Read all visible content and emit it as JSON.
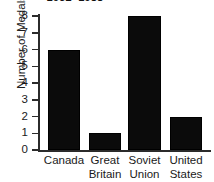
{
  "chart_data": {
    "type": "bar",
    "title": "1932–1988",
    "title_note": "cropped at top edge of screenshot",
    "xlabel": "",
    "ylabel": "Number of Medals",
    "categories": [
      "Canada",
      "Great Britain",
      "Soviet Union",
      "United States"
    ],
    "category_lines": [
      [
        "Canada",
        ""
      ],
      [
        "Great",
        "Britain"
      ],
      [
        "Soviet",
        "Union"
      ],
      [
        "United",
        "States"
      ]
    ],
    "values": [
      6,
      1,
      8,
      2
    ],
    "ylim": [
      0,
      8
    ],
    "yticks": [
      0,
      1,
      2,
      3,
      4,
      5,
      6,
      7,
      8
    ],
    "ytick_labels": [
      "0",
      "1",
      "2",
      "3",
      "4",
      "5",
      "6",
      "7",
      "8"
    ],
    "grid": false,
    "legend": null,
    "bar_color": "#0b0b0b",
    "axis_color": "#2b2b2b",
    "background_color": "#ffffff"
  }
}
